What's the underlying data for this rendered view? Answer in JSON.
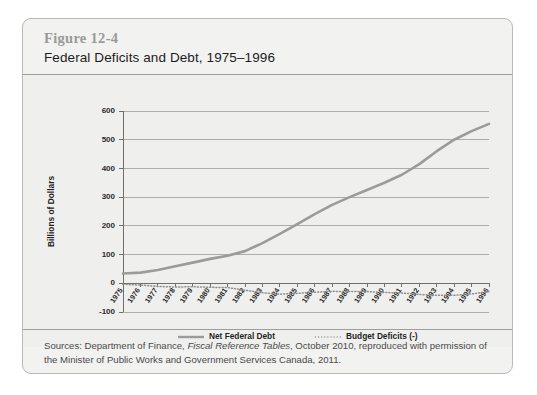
{
  "figure": {
    "number": "Figure 12-4",
    "title": "Federal Deficits and Debt, 1975–1996"
  },
  "source": {
    "prefix": "Sources: Department of Finance, ",
    "italic": "Fiscal Reference Tables",
    "suffix": ", October 2010, reproduced with permission of the Minister of Public Works and Government Services Canada, 2011."
  },
  "chart_data": {
    "type": "line",
    "title": "Federal Deficits and Debt, 1975–1996",
    "xlabel": "",
    "ylabel": "Billions of Dollars",
    "ylim": [
      -100,
      600
    ],
    "yticks": [
      -100,
      0,
      100,
      200,
      300,
      400,
      500,
      600
    ],
    "grid": true,
    "legend_position": "bottom",
    "categories": [
      "1975",
      "1976",
      "1977",
      "1978",
      "1979",
      "1980",
      "1981",
      "1982",
      "1983",
      "1984",
      "1985",
      "1986",
      "1987",
      "1988",
      "1989",
      "1990",
      "1991",
      "1992",
      "1993",
      "1994",
      "1995",
      "1996"
    ],
    "series": [
      {
        "name": "Net Federal Debt",
        "style": "solid",
        "color": "#9b9b9b",
        "values": [
          34,
          37,
          46,
          59,
          72,
          85,
          96,
          112,
          140,
          172,
          206,
          241,
          273,
          300,
          325,
          350,
          378,
          415,
          460,
          500,
          530,
          555
        ]
      },
      {
        "name": "Budget Deficits (-)",
        "style": "dotted",
        "color": "#8f8f8f",
        "values": [
          -4,
          -6,
          -11,
          -13,
          -12,
          -14,
          -15,
          -24,
          -33,
          -38,
          -35,
          -31,
          -28,
          -29,
          -29,
          -32,
          -34,
          -39,
          -42,
          -42,
          -37,
          -29
        ]
      }
    ]
  }
}
